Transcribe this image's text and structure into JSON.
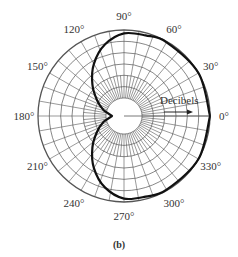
{
  "figure": {
    "caption": "(b)",
    "scale_label": "Decibels",
    "angle_labels": [
      {
        "angle": 0,
        "text": "0°"
      },
      {
        "angle": 30,
        "text": "30°"
      },
      {
        "angle": 60,
        "text": "60°"
      },
      {
        "angle": 90,
        "text": "90°"
      },
      {
        "angle": 120,
        "text": "120°"
      },
      {
        "angle": 150,
        "text": "150°"
      },
      {
        "angle": 180,
        "text": "180°"
      },
      {
        "angle": 210,
        "text": "210°"
      },
      {
        "angle": 240,
        "text": "240°"
      },
      {
        "angle": 270,
        "text": "270°"
      },
      {
        "angle": 300,
        "text": "300°"
      },
      {
        "angle": 330,
        "text": "330°"
      }
    ],
    "colors": {
      "grid": "#555555",
      "curve": "#111111",
      "text": "#333333"
    }
  },
  "chart_data": {
    "type": "polar-line",
    "title": "",
    "caption": "(b)",
    "radial_axis_label": "Decibels",
    "radial_axis_direction": "outward along 0°",
    "angular_ticks_deg": [
      0,
      30,
      60,
      90,
      120,
      150,
      180,
      210,
      240,
      270,
      300,
      330
    ],
    "angular_grid_step_deg": 10,
    "radial_rings": 6,
    "inner_circle_fraction": 0.21,
    "series": [
      {
        "name": "cardioid radiation pattern (dB scale)",
        "description": "Maximum (outer ring) from about 300° through 0° to about 65°; decreases toward 90°/270°; deep null (cusp) near 180° at the inner circle",
        "points_deg_fraction": [
          [
            0,
            1.0
          ],
          [
            30,
            1.0
          ],
          [
            60,
            0.99
          ],
          [
            75,
            0.97
          ],
          [
            90,
            0.96
          ],
          [
            105,
            0.86
          ],
          [
            120,
            0.7
          ],
          [
            135,
            0.52
          ],
          [
            150,
            0.36
          ],
          [
            165,
            0.24
          ],
          [
            180,
            0.14
          ],
          [
            195,
            0.24
          ],
          [
            210,
            0.36
          ],
          [
            225,
            0.52
          ],
          [
            240,
            0.7
          ],
          [
            255,
            0.86
          ],
          [
            270,
            0.96
          ],
          [
            285,
            0.97
          ],
          [
            300,
            0.99
          ],
          [
            330,
            1.0
          ],
          [
            360,
            1.0
          ]
        ]
      }
    ],
    "legend": "none",
    "grid": true
  }
}
